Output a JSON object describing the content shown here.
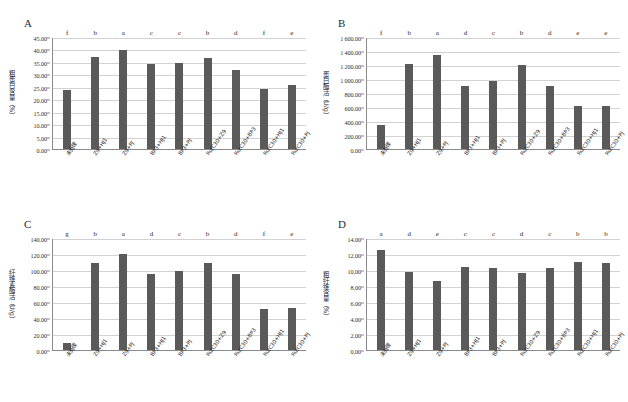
{
  "figure": {
    "categories": [
      "未处理",
      "Z9+HJ1",
      "Z9+PJ",
      "BP3+HJ1",
      "BP3+PJ",
      "RutC30+Z9",
      "RutC30+BP3",
      "RutC30+HJ1",
      "RutC30+PJ"
    ],
    "bar_color": "#5a5a5a",
    "panels": [
      {
        "letter": "A",
        "ylabel": "粗蛋白含量（%）",
        "yticks": [
          "0.00",
          "5.00",
          "10.00",
          "15.00",
          "20.00",
          "25.00",
          "30.00",
          "35.00",
          "40.00",
          "45.00"
        ],
        "ymin": 0,
        "ymax": 45
      },
      {
        "letter": "B",
        "ylabel": "蛋白酶活（U/g）",
        "yticks": [
          "0.00",
          "200.00",
          "400.00",
          "600.00",
          "800.00",
          "1 000.00",
          "1 200.00",
          "1 400.00",
          "1 600.00"
        ],
        "ymin": 0,
        "ymax": 1600
      },
      {
        "letter": "C",
        "ylabel": "纤维素酶活（U/g）",
        "yticks": [
          "0.00",
          "20.00",
          "40.00",
          "60.00",
          "80.00",
          "100.00",
          "120.00",
          "140.00"
        ],
        "ymin": 0,
        "ymax": 140
      },
      {
        "letter": "D",
        "ylabel": "粗纤维含量（%）",
        "yticks": [
          "0.00",
          "2.00",
          "4.00",
          "6.00",
          "8.00",
          "10.00",
          "12.00",
          "14.00"
        ],
        "ymin": 0,
        "ymax": 14
      }
    ]
  },
  "chart_data": [
    {
      "type": "bar",
      "panel": "A",
      "title": "",
      "xlabel": "",
      "ylabel": "粗蛋白含量（%）",
      "ylim": [
        0,
        45
      ],
      "ytick_step": 5,
      "grid": true,
      "legend": "none",
      "categories": [
        "未处理",
        "Z9+HJ1",
        "Z9+PJ",
        "BP3+HJ1",
        "BP3+PJ",
        "RutC30+Z9",
        "RutC30+BP3",
        "RutC30+HJ1",
        "RutC30+PJ"
      ],
      "values": [
        23.7,
        37.0,
        39.7,
        34.1,
        34.4,
        36.7,
        31.8,
        24.2,
        25.8
      ],
      "annotations": [
        "f",
        "b",
        "a",
        "c",
        "c",
        "b",
        "d",
        "f",
        "e"
      ]
    },
    {
      "type": "bar",
      "panel": "B",
      "title": "",
      "xlabel": "",
      "ylabel": "蛋白酶活（U/g）",
      "ylim": [
        0,
        1600
      ],
      "ytick_step": 200,
      "grid": true,
      "legend": "none",
      "categories": [
        "未处理",
        "Z9+HJ1",
        "Z9+PJ",
        "BP3+HJ1",
        "BP3+PJ",
        "RutC30+Z9",
        "RutC30+BP3",
        "RutC30+HJ1",
        "RutC30+PJ"
      ],
      "values": [
        345,
        1215,
        1345,
        895,
        965,
        1205,
        905,
        620,
        615
      ],
      "annotations": [
        "f",
        "b",
        "a",
        "d",
        "c",
        "b",
        "d",
        "e",
        "e"
      ]
    },
    {
      "type": "bar",
      "panel": "C",
      "title": "",
      "xlabel": "",
      "ylabel": "纤维素酶活（U/g）",
      "ylim": [
        0,
        140
      ],
      "ytick_step": 20,
      "grid": true,
      "legend": "none",
      "categories": [
        "未处理",
        "Z9+HJ1",
        "Z9+PJ",
        "BP3+HJ1",
        "BP3+PJ",
        "RutC30+Z9",
        "RutC30+BP3",
        "RutC30+HJ1",
        "RutC30+PJ"
      ],
      "values": [
        8.5,
        108.5,
        119.5,
        94.5,
        99.0,
        108.5,
        94.5,
        51.5,
        53.0
      ],
      "annotations": [
        "g",
        "b",
        "a",
        "d",
        "c",
        "b",
        "d",
        "f",
        "e"
      ]
    },
    {
      "type": "bar",
      "panel": "D",
      "title": "",
      "xlabel": "",
      "ylabel": "粗纤维含量（%）",
      "ylim": [
        0,
        14
      ],
      "ytick_step": 2,
      "grid": true,
      "legend": "none",
      "categories": [
        "未处理",
        "Z9+HJ1",
        "Z9+PJ",
        "BP3+HJ1",
        "BP3+PJ",
        "RutC30+Z9",
        "RutC30+BP3",
        "RutC30+HJ1",
        "RutC30+PJ"
      ],
      "values": [
        12.45,
        9.7,
        8.65,
        10.4,
        10.25,
        9.6,
        10.25,
        11.0,
        10.85
      ],
      "annotations": [
        "a",
        "d",
        "e",
        "c",
        "c",
        "d",
        "c",
        "b",
        "b"
      ]
    }
  ]
}
